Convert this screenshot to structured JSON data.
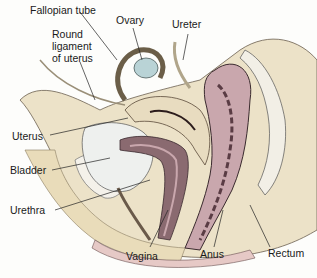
{
  "figure": {
    "labels": {
      "fallopian_tube": "Fallopian tube",
      "ovary": "Ovary",
      "ureter": "Ureter",
      "round_ligament_1": "Round",
      "round_ligament_2": "ligament",
      "round_ligament_3": "of uterus",
      "uterus": "Uterus",
      "bladder": "Bladder",
      "urethra": "Urethra",
      "vagina": "Vagina",
      "anus": "Anus",
      "rectum": "Rectum"
    },
    "colors": {
      "background": "#fdfdfb",
      "tissue_beige": "#e8dcc0",
      "tissue_light": "#f1ead6",
      "organ_pink": "#c9a7ad",
      "organ_dark": "#5a3c44",
      "bladder_white": "#eef0ee",
      "skin_pink": "#e6c9c6",
      "ovary_blue": "#b9d3d6"
    }
  }
}
